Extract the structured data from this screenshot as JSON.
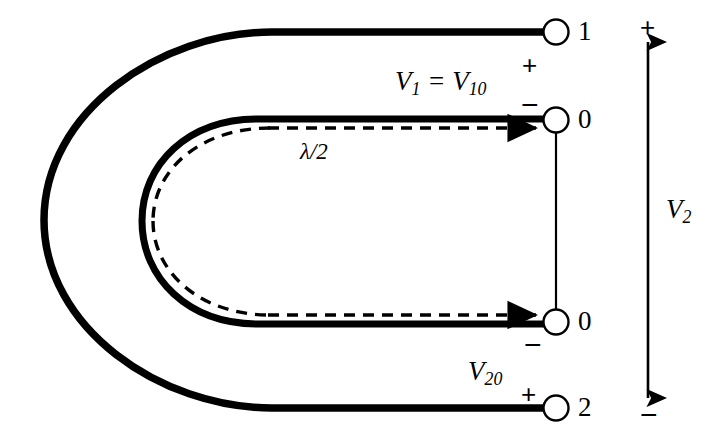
{
  "figure": {
    "type": "transmission-line-hairpin-schematic",
    "background_color": "#ffffff",
    "line_color": "#000000",
    "terminals": [
      {
        "id": "terminal-1",
        "label": "1",
        "x": 556,
        "y": 32
      },
      {
        "id": "terminal-0-upper",
        "label": "0",
        "x": 556,
        "y": 120
      },
      {
        "id": "terminal-0-lower",
        "label": "0",
        "x": 556,
        "y": 322
      },
      {
        "id": "terminal-2",
        "label": "2",
        "x": 556,
        "y": 408
      }
    ],
    "labels": {
      "v1_equals_v10": "V",
      "v1_sub": "1",
      "v1_eq": " = ",
      "v10_main": "V",
      "v10_sub": "10",
      "v20_main": "V",
      "v20_sub": "20",
      "v2_main": "V",
      "v2_sub": "2",
      "lambda_half": "λ/2"
    },
    "polarity_marks": {
      "v1_plus": "+",
      "v1_minus": "−",
      "v20_plus": "+",
      "v20_minus": "−",
      "v2_plus": "+",
      "v2_minus": "−"
    },
    "arrows": {
      "dashed_upper_direction": "right",
      "dashed_lower_direction": "right",
      "v2_arrow_style": "double-headed-vertical"
    }
  }
}
